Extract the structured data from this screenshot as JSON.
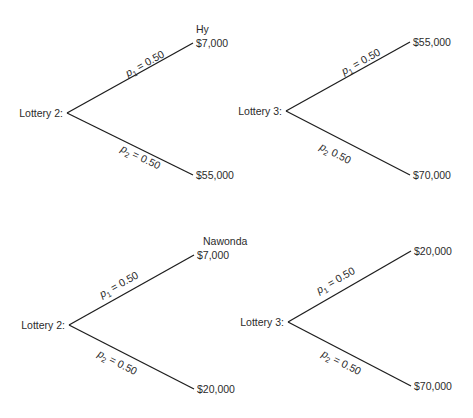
{
  "figure": {
    "groups": [
      {
        "person": "Hy",
        "person_label_pos": [
          196,
          33
        ],
        "trees": [
          {
            "id": "hy-lottery-2",
            "label": "Lottery 2:",
            "node": [
              67,
              113
            ],
            "label_pos": [
              63,
              117
            ],
            "branches": [
              {
                "name": "upper",
                "end": [
                  193,
                  43
                ],
                "prob_var": "p",
                "prob_sub": "1",
                "prob_text": " = 0.50",
                "payoff": "$7,000",
                "payoff_pos": [
                  196,
                  47
                ],
                "label_anchor": [
                  128,
                  77
                ],
                "label_angle": -29
              },
              {
                "name": "lower",
                "end": [
                  193,
                  175
                ],
                "prob_var": "p",
                "prob_sub": "2",
                "prob_text": " = 0.50",
                "payoff": "$55,000",
                "payoff_pos": [
                  196,
                  179
                ],
                "label_anchor": [
                  120,
                  151
                ],
                "label_angle": 26
              }
            ]
          },
          {
            "id": "hy-lottery-3",
            "label": "Lottery 3:",
            "node": [
              286,
              111
            ],
            "label_pos": [
              282,
              115
            ],
            "branches": [
              {
                "name": "upper",
                "end": [
                  410,
                  42
                ],
                "prob_var": "p",
                "prob_sub": "1",
                "prob_text": " = 0.50",
                "payoff": "$55,000",
                "payoff_pos": [
                  413,
                  46
                ],
                "label_anchor": [
                  344,
                  75
                ],
                "label_angle": -29
              },
              {
                "name": "lower",
                "end": [
                  410,
                  175
                ],
                "prob_var": "p",
                "prob_sub": "2",
                "prob_text": " 0.50",
                "payoff": "$70,000",
                "payoff_pos": [
                  413,
                  179
                ],
                "label_anchor": [
                  319,
                  149
                ],
                "label_angle": 27
              }
            ]
          }
        ]
      },
      {
        "person": "Nawonda",
        "person_label_pos": [
          203,
          245
        ],
        "trees": [
          {
            "id": "nawonda-lottery-2",
            "label": "Lottery 2:",
            "node": [
              69,
              325
            ],
            "label_pos": [
              65,
              329
            ],
            "branches": [
              {
                "name": "upper",
                "end": [
                  194,
                  255
                ],
                "prob_var": "p",
                "prob_sub": "1",
                "prob_text": " = 0.50",
                "payoff": "$7,000",
                "payoff_pos": [
                  197,
                  259
                ],
                "label_anchor": [
                  102,
                  298
                ],
                "label_angle": -29
              },
              {
                "name": "lower",
                "end": [
                  194,
                  389
                ],
                "prob_var": "p",
                "prob_sub": "2",
                "prob_text": " = 0.50",
                "payoff": "$20,000",
                "payoff_pos": [
                  197,
                  393
                ],
                "label_anchor": [
                  97,
                  356
                ],
                "label_angle": 27
              }
            ]
          },
          {
            "id": "nawonda-lottery-3",
            "label": "Lottery 3:",
            "node": [
              288,
              322
            ],
            "label_pos": [
              284,
              326
            ],
            "branches": [
              {
                "name": "upper",
                "end": [
                  411,
                  251
                ],
                "prob_var": "p",
                "prob_sub": "1",
                "prob_text": " = 0.50",
                "payoff": "$20,000",
                "payoff_pos": [
                  414,
                  255
                ],
                "label_anchor": [
                  319,
                  294
                ],
                "label_angle": -30
              },
              {
                "name": "lower",
                "end": [
                  411,
                  386
                ],
                "prob_var": "p",
                "prob_sub": "2",
                "prob_text": " = 0.50",
                "payoff": "$70,000",
                "payoff_pos": [
                  414,
                  390
                ],
                "label_anchor": [
                  321,
                  356
                ],
                "label_angle": 27
              }
            ]
          }
        ]
      }
    ]
  }
}
